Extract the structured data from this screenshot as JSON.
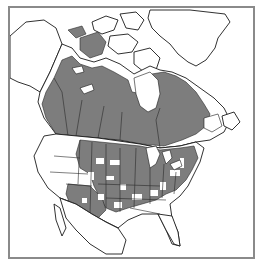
{
  "map": {
    "type": "range-map",
    "region": "North America",
    "colors": {
      "range_fill": "#7d7d7d",
      "land_fill": "#ffffff",
      "outline": "#1a1a1a",
      "frame": "#8a8a8a",
      "background": "#ffffff"
    },
    "shaded_regions": [
      "Canada (boreal and central provinces)",
      "Central and eastern United States (patchy)",
      "Southwestern United States (Arizona, New Mexico, Colorado, Utah)"
    ],
    "unshaded_regions": [
      "Alaska",
      "Yukon and Arctic archipelago",
      "Greenland",
      "Pacific coast states",
      "Southeastern United States",
      "Mexico"
    ]
  }
}
